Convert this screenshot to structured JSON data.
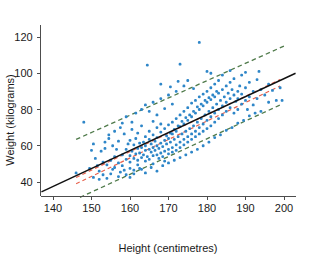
{
  "chart_data": {
    "type": "scatter",
    "title": "",
    "xlabel": "Height (centimetres)",
    "ylabel": "Weight (kilograms)",
    "xlim": [
      136,
      203
    ],
    "ylim": [
      31,
      127
    ],
    "xticks": [
      140,
      150,
      160,
      170,
      180,
      190,
      200
    ],
    "yticks": [
      40,
      60,
      80,
      100,
      120
    ],
    "grid": false,
    "legend": "none",
    "point_color": "#2e86c8",
    "fit_line": {
      "name": "least-squares regression line",
      "color": "#111111",
      "style": "solid",
      "x": [
        137,
        203
      ],
      "y": [
        34.5,
        100.0
      ],
      "slope": 0.9924,
      "intercept": -101.5
    },
    "confidence_band": {
      "name": "95% confidence interval for the mean",
      "color": "#e8604c",
      "style": "dashed",
      "upper": {
        "x": [
          146,
          199
        ],
        "y": [
          42.5,
          96.5
        ]
      },
      "lower": {
        "x": [
          146,
          199
        ],
        "y": [
          39.0,
          93.0
        ]
      }
    },
    "prediction_band": {
      "name": "95% prediction interval",
      "color": "#4f7a4a",
      "style": "dashed",
      "upper": {
        "x": [
          146,
          200
        ],
        "y": [
          63.5,
          115.0
        ]
      },
      "lower": {
        "x": [
          147,
          199
        ],
        "y": [
          31.5,
          82.5
        ]
      }
    },
    "series": [
      {
        "name": "individuals",
        "n": 407,
        "points": [
          [
            146.0,
            45.0
          ],
          [
            148.0,
            73.0
          ],
          [
            149.5,
            47.5
          ],
          [
            150.0,
            57.5
          ],
          [
            150.5,
            61.0
          ],
          [
            151.0,
            53.0
          ],
          [
            151.5,
            49.0
          ],
          [
            152.0,
            41.5
          ],
          [
            152.5,
            57.0
          ],
          [
            153.0,
            51.0
          ],
          [
            153.5,
            58.5
          ],
          [
            154.0,
            49.5
          ],
          [
            154.5,
            66.0
          ],
          [
            155.0,
            52.0
          ],
          [
            155.0,
            44.5
          ],
          [
            155.5,
            60.0
          ],
          [
            156.0,
            54.0
          ],
          [
            156.0,
            48.0
          ],
          [
            156.5,
            58.0
          ],
          [
            157.0,
            50.5
          ],
          [
            157.0,
            62.5
          ],
          [
            157.5,
            45.5
          ],
          [
            158.0,
            55.0
          ],
          [
            158.0,
            49.0
          ],
          [
            158.5,
            66.5
          ],
          [
            159.0,
            52.5
          ],
          [
            159.0,
            58.0
          ],
          [
            159.0,
            44.0
          ],
          [
            159.5,
            61.0
          ],
          [
            160.0,
            54.5
          ],
          [
            160.0,
            47.5
          ],
          [
            160.0,
            63.0
          ],
          [
            160.0,
            51.0
          ],
          [
            160.5,
            57.0
          ],
          [
            160.5,
            69.0
          ],
          [
            161.0,
            53.0
          ],
          [
            161.0,
            60.5
          ],
          [
            161.0,
            46.5
          ],
          [
            161.5,
            55.5
          ],
          [
            161.5,
            64.0
          ],
          [
            162.0,
            52.0
          ],
          [
            162.0,
            58.5
          ],
          [
            162.0,
            49.5
          ],
          [
            162.0,
            67.0
          ],
          [
            162.5,
            56.0
          ],
          [
            162.5,
            61.5
          ],
          [
            163.0,
            53.5
          ],
          [
            163.0,
            59.0
          ],
          [
            163.0,
            47.0
          ],
          [
            163.0,
            71.0
          ],
          [
            163.5,
            55.0
          ],
          [
            163.5,
            62.0
          ],
          [
            164.0,
            57.5
          ],
          [
            164.0,
            51.5
          ],
          [
            164.0,
            65.0
          ],
          [
            164.0,
            60.0
          ],
          [
            164.5,
            54.0
          ],
          [
            164.5,
            104.5
          ],
          [
            165.0,
            58.0
          ],
          [
            165.0,
            63.5
          ],
          [
            165.0,
            52.5
          ],
          [
            165.0,
            68.0
          ],
          [
            165.5,
            56.5
          ],
          [
            165.5,
            61.0
          ],
          [
            166.0,
            59.0
          ],
          [
            166.0,
            54.5
          ],
          [
            166.0,
            66.0
          ],
          [
            166.0,
            50.0
          ],
          [
            166.5,
            57.5
          ],
          [
            166.5,
            62.5
          ],
          [
            167.0,
            60.0
          ],
          [
            167.0,
            55.0
          ],
          [
            167.0,
            70.0
          ],
          [
            167.0,
            64.5
          ],
          [
            167.5,
            58.5
          ],
          [
            167.5,
            53.0
          ],
          [
            168.0,
            61.5
          ],
          [
            168.0,
            56.0
          ],
          [
            168.0,
            67.5
          ],
          [
            168.0,
            72.0
          ],
          [
            168.5,
            59.5
          ],
          [
            168.5,
            54.0
          ],
          [
            169.0,
            63.0
          ],
          [
            169.0,
            57.0
          ],
          [
            169.0,
            69.5
          ],
          [
            169.0,
            51.5
          ],
          [
            169.5,
            61.0
          ],
          [
            169.5,
            65.5
          ],
          [
            170.0,
            58.0
          ],
          [
            170.0,
            64.0
          ],
          [
            170.0,
            71.5
          ],
          [
            170.0,
            55.5
          ],
          [
            170.5,
            62.0
          ],
          [
            170.5,
            67.0
          ],
          [
            171.0,
            59.0
          ],
          [
            171.0,
            66.5
          ],
          [
            171.0,
            73.0
          ],
          [
            171.0,
            56.5
          ],
          [
            171.5,
            63.5
          ],
          [
            171.5,
            69.0
          ],
          [
            172.0,
            60.5
          ],
          [
            172.0,
            68.0
          ],
          [
            172.0,
            75.0
          ],
          [
            172.0,
            57.5
          ],
          [
            172.5,
            65.0
          ],
          [
            172.5,
            71.0
          ],
          [
            173.0,
            62.0
          ],
          [
            173.0,
            70.5
          ],
          [
            173.0,
            77.0
          ],
          [
            173.0,
            59.0
          ],
          [
            173.0,
            105.0
          ],
          [
            173.5,
            66.5
          ],
          [
            173.5,
            73.5
          ],
          [
            174.0,
            63.5
          ],
          [
            174.0,
            72.0
          ],
          [
            174.0,
            79.0
          ],
          [
            174.0,
            60.5
          ],
          [
            174.5,
            68.0
          ],
          [
            174.5,
            75.5
          ],
          [
            175.0,
            65.0
          ],
          [
            175.0,
            74.0
          ],
          [
            175.0,
            81.0
          ],
          [
            175.0,
            62.0
          ],
          [
            175.0,
            96.0
          ],
          [
            175.5,
            69.5
          ],
          [
            175.5,
            77.0
          ],
          [
            176.0,
            66.5
          ],
          [
            176.0,
            76.0
          ],
          [
            176.0,
            83.5
          ],
          [
            176.0,
            63.5
          ],
          [
            176.5,
            71.0
          ],
          [
            176.5,
            79.0
          ],
          [
            177.0,
            68.0
          ],
          [
            177.0,
            78.0
          ],
          [
            177.0,
            85.0
          ],
          [
            177.0,
            65.0
          ],
          [
            177.5,
            73.0
          ],
          [
            177.5,
            81.5
          ],
          [
            178.0,
            70.0
          ],
          [
            178.0,
            80.0
          ],
          [
            178.0,
            87.0
          ],
          [
            178.0,
            66.5
          ],
          [
            178.0,
            117.0
          ],
          [
            178.5,
            75.0
          ],
          [
            178.5,
            83.0
          ],
          [
            179.0,
            72.0
          ],
          [
            179.0,
            82.0
          ],
          [
            179.0,
            88.5
          ],
          [
            179.0,
            68.0
          ],
          [
            179.5,
            77.0
          ],
          [
            179.5,
            85.0
          ],
          [
            180.0,
            74.0
          ],
          [
            180.0,
            84.0
          ],
          [
            180.0,
            90.0
          ],
          [
            180.0,
            69.5
          ],
          [
            180.0,
            101.0
          ],
          [
            180.5,
            79.0
          ],
          [
            180.5,
            86.5
          ],
          [
            181.0,
            76.0
          ],
          [
            181.0,
            85.5
          ],
          [
            181.0,
            92.0
          ],
          [
            181.0,
            71.0
          ],
          [
            181.5,
            81.0
          ],
          [
            181.5,
            88.0
          ],
          [
            182.0,
            78.0
          ],
          [
            182.0,
            87.0
          ],
          [
            182.0,
            94.0
          ],
          [
            182.0,
            73.0
          ],
          [
            182.5,
            83.0
          ],
          [
            182.5,
            90.0
          ],
          [
            183.0,
            80.0
          ],
          [
            183.0,
            89.0
          ],
          [
            183.0,
            75.0
          ],
          [
            183.0,
            96.0
          ],
          [
            183.5,
            85.0
          ],
          [
            184.0,
            82.0
          ],
          [
            184.0,
            91.0
          ],
          [
            184.0,
            77.0
          ],
          [
            184.5,
            87.0
          ],
          [
            185.0,
            84.0
          ],
          [
            185.0,
            93.0
          ],
          [
            185.0,
            79.0
          ],
          [
            185.5,
            89.0
          ],
          [
            186.0,
            86.0
          ],
          [
            186.0,
            95.0
          ],
          [
            186.0,
            81.0
          ],
          [
            186.5,
            91.0
          ],
          [
            187.0,
            88.0
          ],
          [
            187.0,
            78.0
          ],
          [
            187.0,
            97.0
          ],
          [
            187.5,
            84.5
          ],
          [
            188.0,
            90.0
          ],
          [
            188.0,
            80.0
          ],
          [
            188.0,
            86.0
          ],
          [
            188.5,
            93.0
          ],
          [
            189.0,
            83.0
          ],
          [
            189.0,
            88.5
          ],
          [
            189.0,
            99.0
          ],
          [
            190.0,
            85.0
          ],
          [
            190.0,
            92.0
          ],
          [
            190.5,
            80.0
          ],
          [
            191.0,
            87.0
          ],
          [
            191.0,
            95.0
          ],
          [
            192.0,
            82.5
          ],
          [
            192.0,
            90.0
          ],
          [
            193.0,
            86.0
          ],
          [
            193.0,
            96.5
          ],
          [
            194.0,
            79.0
          ],
          [
            194.0,
            91.0
          ],
          [
            195.0,
            88.0
          ],
          [
            196.0,
            84.0
          ],
          [
            197.0,
            90.5
          ],
          [
            198.0,
            85.0
          ],
          [
            199.0,
            92.0
          ],
          [
            199.5,
            85.0
          ],
          [
            150.5,
            42.5
          ],
          [
            152.0,
            46.0
          ],
          [
            153.0,
            44.0
          ],
          [
            154.0,
            42.0
          ],
          [
            155.5,
            47.0
          ],
          [
            157.0,
            43.0
          ],
          [
            158.5,
            46.5
          ],
          [
            160.0,
            42.5
          ],
          [
            161.0,
            44.5
          ],
          [
            162.5,
            47.5
          ],
          [
            164.0,
            45.0
          ],
          [
            165.5,
            48.0
          ],
          [
            167.0,
            46.0
          ],
          [
            168.5,
            49.0
          ],
          [
            170.0,
            50.5
          ],
          [
            171.5,
            52.0
          ],
          [
            173.0,
            53.5
          ],
          [
            174.5,
            55.0
          ],
          [
            176.0,
            56.5
          ],
          [
            177.5,
            58.0
          ],
          [
            179.0,
            60.0
          ],
          [
            180.5,
            62.0
          ],
          [
            182.0,
            64.5
          ],
          [
            183.5,
            66.0
          ],
          [
            185.0,
            68.5
          ],
          [
            186.5,
            70.0
          ],
          [
            188.0,
            72.5
          ],
          [
            189.5,
            74.0
          ],
          [
            191.0,
            76.5
          ],
          [
            192.5,
            78.0
          ],
          [
            163.0,
            80.0
          ],
          [
            164.0,
            82.5
          ],
          [
            165.0,
            79.0
          ],
          [
            166.0,
            84.0
          ],
          [
            167.0,
            77.0
          ],
          [
            168.0,
            86.0
          ],
          [
            169.0,
            80.5
          ],
          [
            170.0,
            88.0
          ],
          [
            171.0,
            83.0
          ],
          [
            172.0,
            90.0
          ],
          [
            159.0,
            76.0
          ],
          [
            160.5,
            73.0
          ],
          [
            161.5,
            78.0
          ],
          [
            157.5,
            70.0
          ],
          [
            158.0,
            72.5
          ],
          [
            156.0,
            68.0
          ],
          [
            154.5,
            64.0
          ],
          [
            153.5,
            62.0
          ],
          [
            166.0,
            73.5
          ],
          [
            168.0,
            94.0
          ],
          [
            170.5,
            92.5
          ],
          [
            172.5,
            95.5
          ],
          [
            174.0,
            93.0
          ],
          [
            176.5,
            91.5
          ],
          [
            181.0,
            100.0
          ],
          [
            184.0,
            99.0
          ],
          [
            186.0,
            101.5
          ],
          [
            190.0,
            100.5
          ],
          [
            193.5,
            101.0
          ],
          [
            196.0,
            94.0
          ]
        ]
      }
    ]
  },
  "axes": {
    "x_tick_labels": [
      "140",
      "150",
      "160",
      "170",
      "180",
      "190",
      "200"
    ],
    "y_tick_labels": [
      "40",
      "60",
      "80",
      "100",
      "120"
    ],
    "x_title": "Height (centimetres)",
    "y_title": "Weight (kilograms)"
  },
  "colors": {
    "point": "#2e86c8",
    "regression": "#111111",
    "confidence": "#e8604c",
    "prediction": "#4f7a4a",
    "axis": "#4d4d4d",
    "text": "#1a1a1a",
    "background": "#ffffff"
  }
}
